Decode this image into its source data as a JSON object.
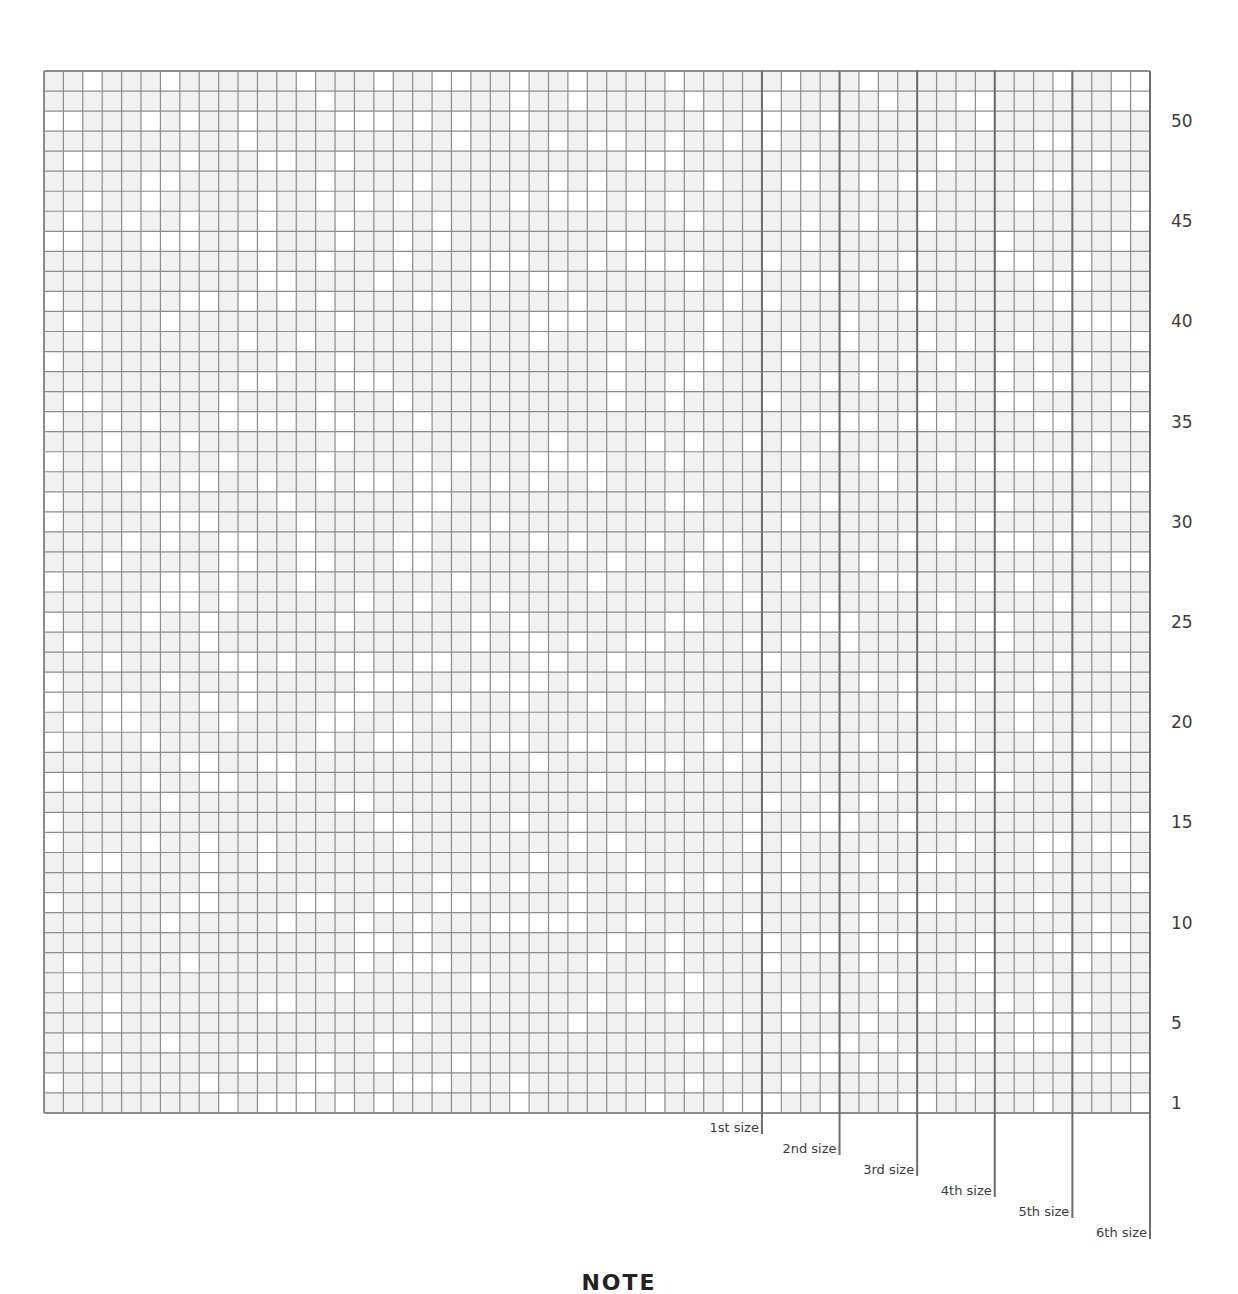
{
  "chart_data": {
    "type": "table",
    "grid": {
      "columns": 57,
      "rows": 52,
      "cell_fill": "#f1f1f1",
      "cell_fill_alt": "#ffffff",
      "line_color": "#8c8c8c",
      "size_line_color": "#6c6c6c"
    },
    "row_labels": [
      "1",
      "5",
      "10",
      "15",
      "20",
      "25",
      "30",
      "35",
      "40",
      "45",
      "50"
    ],
    "row_label_rows": [
      1,
      5,
      10,
      15,
      20,
      25,
      30,
      35,
      40,
      45,
      50
    ],
    "size_markers": [
      {
        "label": "1st size",
        "column_boundary": 37
      },
      {
        "label": "2nd size",
        "column_boundary": 41
      },
      {
        "label": "3rd size",
        "column_boundary": 45
      },
      {
        "label": "4th size",
        "column_boundary": 49
      },
      {
        "label": "5th size",
        "column_boundary": 53
      },
      {
        "label": "6th size",
        "column_boundary": 57
      }
    ],
    "xlabel": "",
    "ylabel": "",
    "legend": []
  },
  "footer": {
    "note_heading": "NOTE"
  }
}
